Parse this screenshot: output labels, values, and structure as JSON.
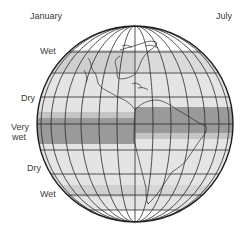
{
  "header": {
    "left_label": "January",
    "right_label": "July"
  },
  "side_labels": [
    {
      "text": "Wet",
      "x": 40,
      "y": 50
    },
    {
      "text": "Dry",
      "x": 22,
      "y": 94
    },
    {
      "text": "Very",
      "x": 12,
      "y": 124
    },
    {
      "text": "wet",
      "x": 13,
      "y": 134
    },
    {
      "text": "Dry",
      "x": 27,
      "y": 164
    },
    {
      "text": "Wet",
      "x": 40,
      "y": 189
    }
  ],
  "colors": {
    "outline": "#1e1e1e",
    "grid": "#2a2a2a",
    "light": "#e4e4e4",
    "medium": "#c9c9c9",
    "dark": "#9a9a9a",
    "white": "#ffffff"
  }
}
